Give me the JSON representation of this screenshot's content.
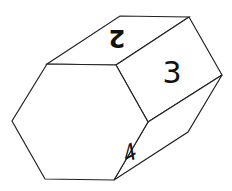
{
  "diagram": {
    "type": "hexagonal-prism-die",
    "faces": [
      {
        "name": "front-hexagon",
        "label": ""
      },
      {
        "name": "top-face",
        "label": "2"
      },
      {
        "name": "right-upper-face",
        "label": "3"
      },
      {
        "name": "right-lower-face",
        "label": "4"
      }
    ],
    "colors": {
      "stroke": "#222222",
      "fill": "#ffffff",
      "text": "#111111"
    }
  }
}
